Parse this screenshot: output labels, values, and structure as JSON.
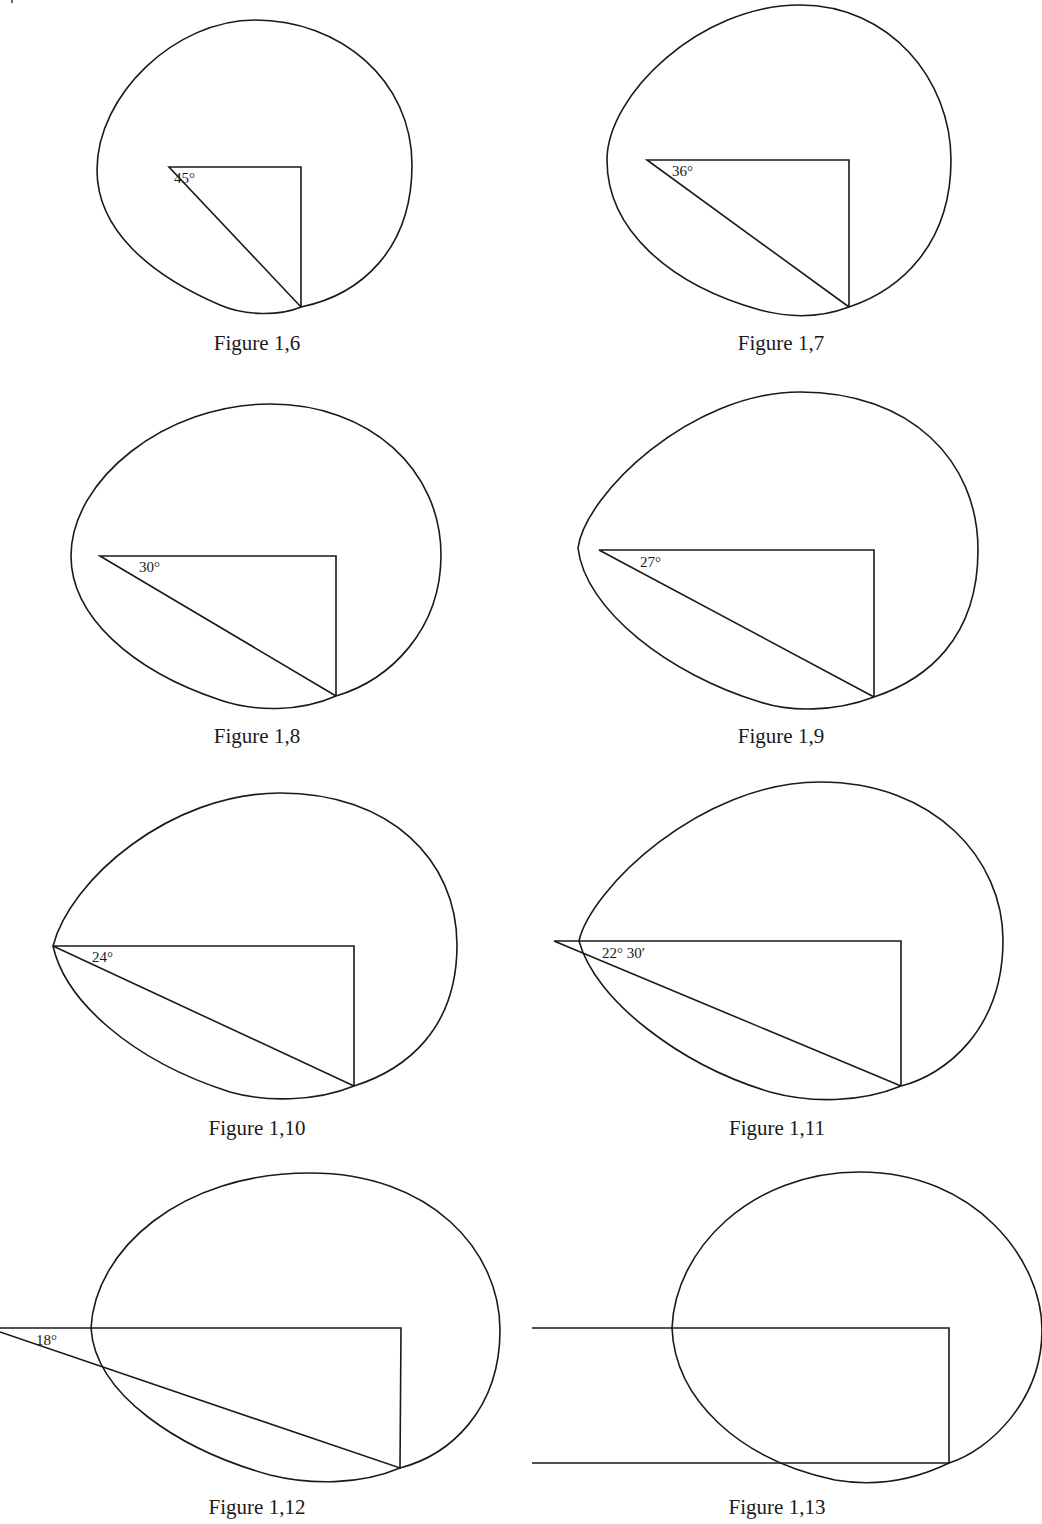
{
  "figures": [
    {
      "id": "fig-1-6",
      "caption": "Figure 1,6",
      "angle_label": "45°"
    },
    {
      "id": "fig-1-7",
      "caption": "Figure 1,7",
      "angle_label": "36°"
    },
    {
      "id": "fig-1-8",
      "caption": "Figure 1,8",
      "angle_label": "30°"
    },
    {
      "id": "fig-1-9",
      "caption": "Figure 1,9",
      "angle_label": "27°"
    },
    {
      "id": "fig-1-10",
      "caption": "Figure 1,10",
      "angle_label": "24°"
    },
    {
      "id": "fig-1-11",
      "caption": "Figure 1,11",
      "angle_label": "22° 30′"
    },
    {
      "id": "fig-1-12",
      "caption": "Figure 1,12",
      "angle_label": "18°"
    },
    {
      "id": "fig-1-13",
      "caption": "Figure 1,13",
      "angle_label": ""
    }
  ],
  "colors": {
    "ink": "#1a1a1a",
    "paper": "#ffffff"
  }
}
